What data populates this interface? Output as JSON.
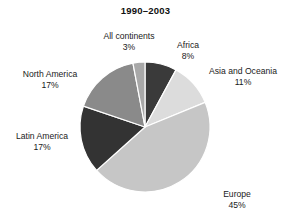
{
  "chart_data": {
    "type": "pie",
    "title": "1990–2003",
    "categories": [
      "Africa",
      "Asia and Oceania",
      "Europe",
      "Latin America",
      "North America",
      "All continents"
    ],
    "values": [
      8,
      11,
      45,
      17,
      17,
      3
    ],
    "value_suffix": "%",
    "start_angle_deg": 0,
    "direction": "clockwise",
    "legend": "none",
    "grid": false,
    "colors": [
      "#3a3a3a",
      "#dcdcdc",
      "#c6c6c6",
      "#333333",
      "#8a8a8a",
      "#a8a8a8"
    ],
    "slices": [
      {
        "name": "Africa",
        "value": 8,
        "label": "8%",
        "color": "#3a3a3a"
      },
      {
        "name": "Asia and Oceania",
        "value": 11,
        "label": "11%",
        "color": "#dcdcdc"
      },
      {
        "name": "Europe",
        "value": 45,
        "label": "45%",
        "color": "#c6c6c6"
      },
      {
        "name": "Latin America",
        "value": 17,
        "label": "17%",
        "color": "#333333"
      },
      {
        "name": "North America",
        "value": 17,
        "label": "17%",
        "color": "#8a8a8a"
      },
      {
        "name": "All continents",
        "value": 3,
        "label": "3%",
        "color": "#a8a8a8"
      }
    ],
    "geometry": {
      "cx": 145,
      "cy": 127,
      "r": 65
    }
  }
}
